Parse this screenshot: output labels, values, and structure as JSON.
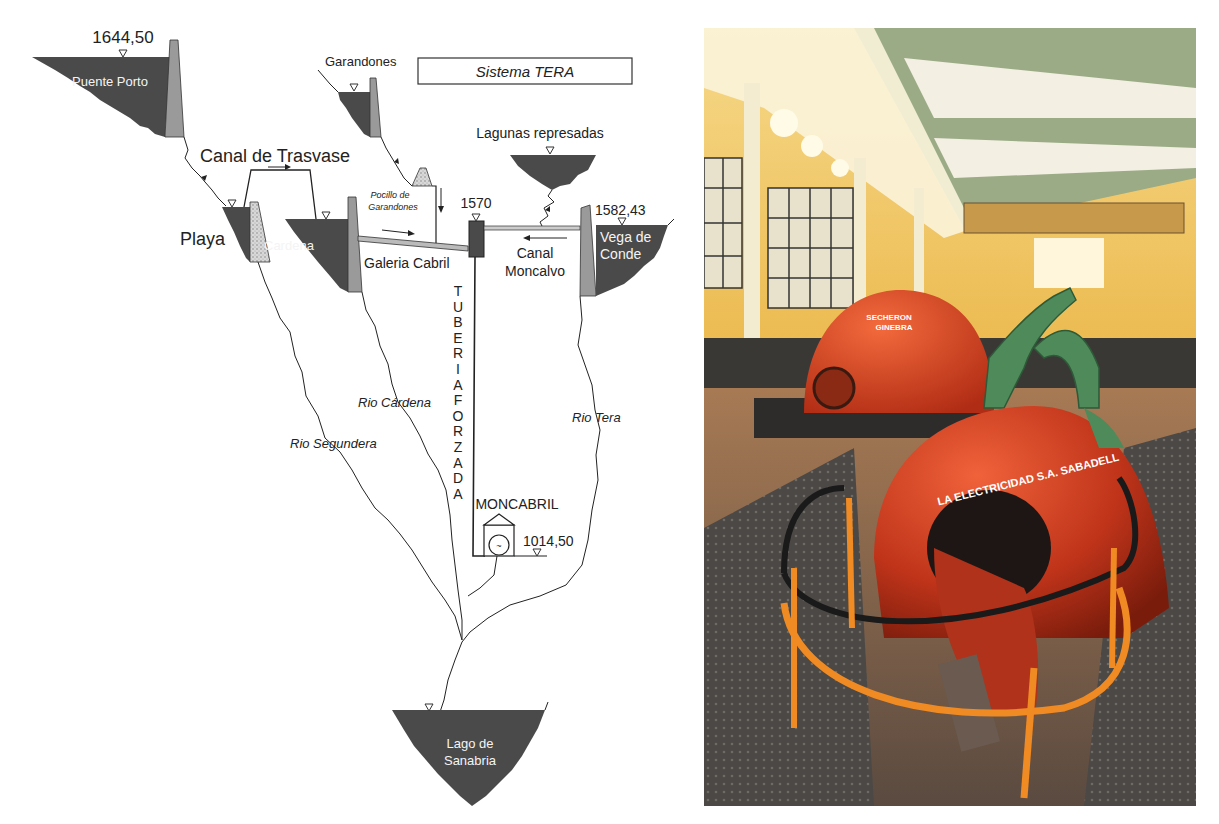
{
  "diagram": {
    "title": "Sistema TERA",
    "reservoirs": {
      "puente_porto": {
        "name": "Puente Porto",
        "elevation": "1644,50"
      },
      "garandones": {
        "name": "Garandones"
      },
      "playa": {
        "name": "Playa"
      },
      "cardena": {
        "name": "Cardena"
      },
      "lagunas": {
        "name": "Lagunas represadas"
      },
      "vega_de_conde": {
        "name_line1": "Vega de",
        "name_line2": "Conde",
        "elevation": "1582,43"
      },
      "sanabria": {
        "name_line1": "Lago de",
        "name_line2": "Sanabria"
      }
    },
    "canal_trasvase": "Canal de Trasvase",
    "pocillo_line1": "Pocillo de",
    "pocillo_line2": "Garandones",
    "chamber_elevation": "1570",
    "galeria": "Galeria Cabril",
    "canal_moncalvo_line1": "Canal",
    "canal_moncalvo_line2": "Moncalvo",
    "penstock_letters": [
      "T",
      "U",
      "B",
      "E",
      "R",
      "I",
      "A",
      "F",
      "O",
      "R",
      "Z",
      "A",
      "D",
      "A"
    ],
    "powerhouse": {
      "name": "MONCABRIL",
      "elevation": "1014,50"
    },
    "rivers": {
      "segundera": "Rio Segundera",
      "cardena": "Rio Cárdena",
      "tera": "Rio Tera"
    },
    "colors": {
      "reservoir_fill": "#4a4a4a",
      "dam_fill": "#9a9a9a",
      "line": "#222222"
    }
  },
  "photo": {
    "subject": "Moncabril hydroelectric power station interior",
    "generator_front_text": "LA ELECTRICIDAD S.A. SABADELL",
    "generator_back_text_line1": "SECHERON",
    "generator_back_text_line2": "GINEBRA",
    "colors": {
      "wall": "#e9b43c",
      "ceiling": "#9aab86",
      "generator": "#c9391c",
      "turbine": "#4e8a5a",
      "railing": "#f08a22",
      "floor": "#6b5a4c"
    }
  }
}
